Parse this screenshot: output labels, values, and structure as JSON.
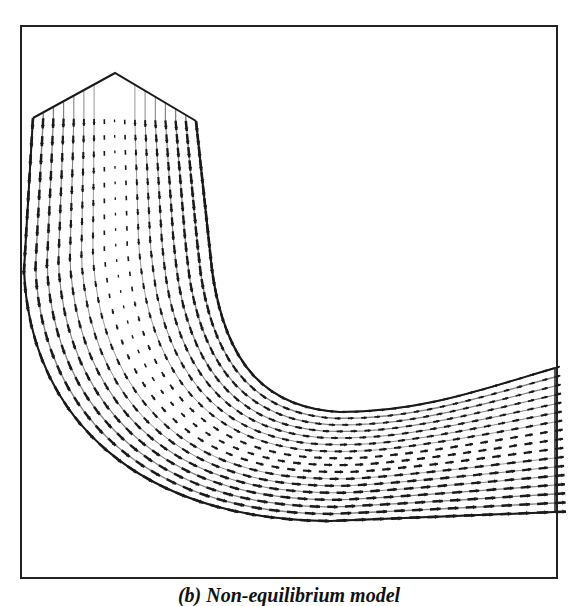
{
  "chart_data": {
    "type": "vector_field",
    "title": "",
    "caption": "(b) Non-equilibrium model",
    "xlabel": "",
    "ylabel": "",
    "grid": false,
    "legend": null,
    "frame": {
      "x": 21,
      "y": 26,
      "width": 536,
      "height": 552,
      "color": "#222222"
    },
    "inlet": {
      "peak": [
        115,
        73
      ],
      "left_corner": [
        33,
        118
      ],
      "right_corner": [
        196,
        121
      ],
      "flow_direction": "down"
    },
    "walls": {
      "outer_path": "M33,118 L24,270 C30,420 140,520 330,521 L555,512",
      "inner_path": "M196,121 L212,270 C226,370 270,408 340,412 C420,412 480,390 555,368"
    },
    "outlet": {
      "x": 555,
      "top_y": 368,
      "bottom_y": 512,
      "flow_direction": "right"
    },
    "grid_resolution": {
      "streamwise_stations": 46,
      "cross_stream_points": 17
    },
    "profile": {
      "inlet_wall_speed": 1.0,
      "inlet_center_speed": 0.08,
      "outlet_outer_speed": 1.0,
      "outlet_inner_speed": 0.35
    },
    "colors": {
      "line": "#1a1a1a",
      "background": "#ffffff"
    }
  }
}
